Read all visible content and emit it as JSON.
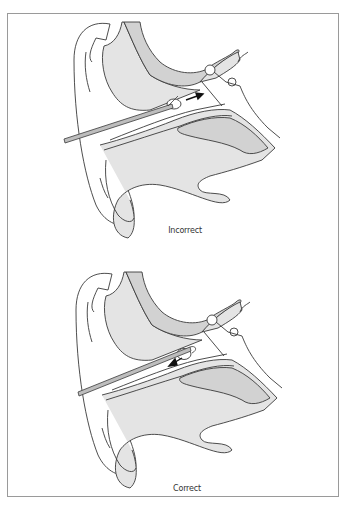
{
  "figure": {
    "panels": [
      {
        "id": "top",
        "caption": "Incorrect",
        "instrument_direction": "inward",
        "arrow": "points toward eardrum (right)"
      },
      {
        "id": "bottom",
        "caption": "Correct",
        "instrument_direction": "outward",
        "arrow": "points out of ear canal (left)"
      }
    ],
    "colors": {
      "tissue_fill": "#e4e4e4",
      "bone_fill": "#d2d2d2",
      "outline": "#3a3a3a",
      "frame_border": "#9a9a9a",
      "instrument": "#bdbdbd"
    }
  }
}
